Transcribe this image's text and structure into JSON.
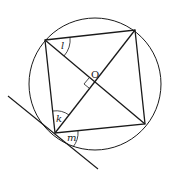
{
  "diagram": {
    "colors": {
      "stroke": "#1a1a1a",
      "background": "#ffffff"
    },
    "circle": {
      "cx": 95,
      "cy": 84,
      "r": 66
    },
    "center_label": "O",
    "vertices": {
      "top_left": [
        45,
        40
      ],
      "top_right": [
        135,
        30
      ],
      "bottom_right": [
        145,
        124
      ],
      "bottom_left": [
        55,
        133
      ]
    },
    "tangent": {
      "from": [
        8,
        96
      ],
      "to": [
        98,
        169
      ]
    },
    "angle_labels": {
      "l": "l",
      "k": "k",
      "m": "m"
    },
    "right_angle_marker": true
  }
}
